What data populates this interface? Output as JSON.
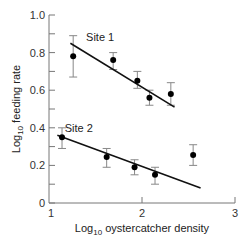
{
  "chart_data": {
    "type": "scatter",
    "title": "",
    "xlabel": "Log10 oystercatcher density",
    "ylabel": "Log10 feeding rate",
    "xlabel_parts": {
      "prefix": "Log",
      "sub": "10",
      "suffix": " oystercatcher density"
    },
    "ylabel_parts": {
      "prefix": "Log",
      "sub": "10",
      "suffix": " feeding rate"
    },
    "xlim": [
      1,
      3
    ],
    "ylim": [
      0,
      1.0
    ],
    "x_ticks": [
      1,
      2,
      3
    ],
    "x_tick_labels": [
      "1",
      "2",
      "3"
    ],
    "y_ticks": [
      0,
      0.2,
      0.4,
      0.6,
      0.8,
      1.0
    ],
    "y_tick_labels": [
      "0",
      "0.2",
      "0.4",
      "0.6",
      "0.8",
      "1.0"
    ],
    "y_minor_ticks": [
      0.1,
      0.3,
      0.5,
      0.7,
      0.9
    ],
    "grid": false,
    "legend": "none (series labelled inline)",
    "series": [
      {
        "name": "Site 1",
        "label_pos": {
          "x": 1.55,
          "y": 0.86
        },
        "points": [
          {
            "x": 1.26,
            "y": 0.78,
            "err_hi": 0.89,
            "err_lo": 0.67
          },
          {
            "x": 1.69,
            "y": 0.76,
            "err_hi": 0.8,
            "err_lo": 0.71
          },
          {
            "x": 1.95,
            "y": 0.65,
            "err_hi": 0.7,
            "err_lo": 0.61
          },
          {
            "x": 2.08,
            "y": 0.56,
            "err_hi": 0.6,
            "err_lo": 0.52
          },
          {
            "x": 2.31,
            "y": 0.58,
            "err_hi": 0.64,
            "err_lo": 0.52
          }
        ],
        "fit_line": {
          "x0": 1.23,
          "y0": 0.85,
          "x1": 2.35,
          "y1": 0.51
        }
      },
      {
        "name": "Site 2",
        "label_pos": {
          "x": 1.32,
          "y": 0.38
        },
        "points": [
          {
            "x": 1.14,
            "y": 0.35,
            "err_hi": 0.4,
            "err_lo": 0.29
          },
          {
            "x": 1.62,
            "y": 0.245,
            "err_hi": 0.29,
            "err_lo": 0.19
          },
          {
            "x": 1.92,
            "y": 0.19,
            "err_hi": 0.23,
            "err_lo": 0.15
          },
          {
            "x": 2.14,
            "y": 0.15,
            "err_hi": 0.19,
            "err_lo": 0.1
          },
          {
            "x": 2.55,
            "y": 0.255,
            "err_hi": 0.31,
            "err_lo": 0.2
          }
        ],
        "fit_line": {
          "x0": 1.09,
          "y0": 0.36,
          "x1": 2.63,
          "y1": 0.08
        }
      }
    ]
  },
  "colors": {
    "axis": "#777777",
    "line": "#111111",
    "point": "#000000",
    "errorbar": "#888888",
    "text": "#333333"
  }
}
